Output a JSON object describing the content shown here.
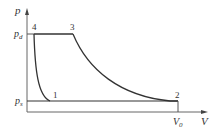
{
  "diagram": {
    "axes": {
      "y_label": "p",
      "x_label": "V",
      "y_ticks": [
        {
          "main": "p",
          "sub": "d"
        },
        {
          "main": "p",
          "sub": "s"
        }
      ],
      "x_ticks": [
        {
          "main": "V",
          "sub": "0"
        }
      ]
    },
    "points": [
      {
        "id": "1",
        "label": "1"
      },
      {
        "id": "2",
        "label": "2"
      },
      {
        "id": "3",
        "label": "3"
      },
      {
        "id": "4",
        "label": "4"
      }
    ],
    "processes": [
      {
        "from": "1",
        "to": "2",
        "type": "isobaric suction at p_s"
      },
      {
        "from": "2",
        "to": "3",
        "type": "compression curve"
      },
      {
        "from": "3",
        "to": "4",
        "type": "isobaric discharge at p_d"
      },
      {
        "from": "4",
        "to": "1",
        "type": "re-expansion curve"
      }
    ],
    "colors": {
      "line": "#333333",
      "axis": "#555555"
    }
  }
}
